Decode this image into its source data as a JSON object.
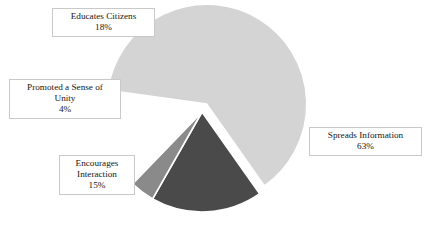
{
  "chart_data": {
    "type": "pie",
    "title": "",
    "subtitle": "",
    "xlabel": "",
    "ylabel": "",
    "legend_position": "none",
    "grid": false,
    "labels_show_percent": true,
    "categories": [
      "Spreads Information",
      "Educates Citizens",
      "Promoted a Sense of Unity",
      "Encourages Interaction"
    ],
    "values": [
      63,
      18,
      4,
      15
    ],
    "units": "%",
    "total": 100,
    "slices": [
      {
        "label": "Spreads Information",
        "value": 63,
        "value_text": "63%",
        "color": "#d4d4d4",
        "exploded": true,
        "start_angle_deg": 8,
        "end_angle_deg": 234.8
      },
      {
        "label": "Educates Citizens",
        "value": 18,
        "value_text": "18%",
        "color": "#4a4a4a",
        "exploded": false,
        "start_angle_deg": 295.2,
        "end_angle_deg": 360
      },
      {
        "label": "Promoted a Sense of Unity",
        "value": 4,
        "value_text": "4%",
        "color": "#8a8a8a",
        "exploded": false,
        "start_angle_deg": 280.8,
        "end_angle_deg": 295.2
      },
      {
        "label": "Encourages Interaction",
        "value": 15,
        "value_text": "15%",
        "color": "#ffffff",
        "exploded": false,
        "start_angle_deg": 226.8,
        "end_angle_deg": 280.8
      }
    ]
  },
  "labels": {
    "educates_citizens": {
      "title": "Educates Citizens",
      "value": "18%"
    },
    "promoted_sense_unity": {
      "title_line1": "Promoted a Sense of",
      "title_line2": "Unity",
      "value": "4%"
    },
    "encourages_interaction": {
      "title_line1": "Encourages",
      "title_line2": "Interaction",
      "value": "15%"
    },
    "spreads_information": {
      "title": "Spreads Information",
      "value": "63%"
    }
  },
  "colors": {
    "background": "#ffffff",
    "slice_light": "#d4d4d4",
    "slice_dark": "#4a4a4a",
    "slice_medium": "#8a8a8a",
    "slice_white": "#ffffff",
    "label_border": "#c9c9c9",
    "text": "#161616"
  }
}
